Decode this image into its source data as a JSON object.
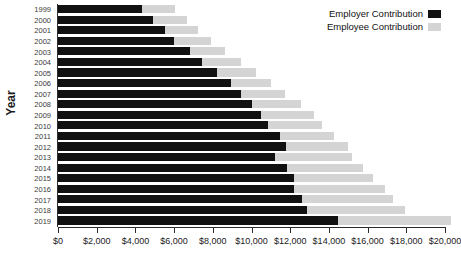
{
  "chart_data": {
    "type": "bar",
    "orientation": "horizontal",
    "stacked": true,
    "title": "",
    "xlabel": "",
    "ylabel": "Year",
    "xlim": [
      0,
      20000
    ],
    "ylim_categories": 21,
    "grid": false,
    "legend_position": "top-right",
    "categories": [
      "1999",
      "2000",
      "2001",
      "2002",
      "2003",
      "2004",
      "2005",
      "2006",
      "2007",
      "2008",
      "2009",
      "2010",
      "2011",
      "2012",
      "2013",
      "2014",
      "2015",
      "2016",
      "2017",
      "2018",
      "2019"
    ],
    "series": [
      {
        "name": "Employer Contribution",
        "color": "#111111",
        "values": [
          4360,
          4930,
          5520,
          5990,
          6830,
          7460,
          8240,
          8930,
          9450,
          10030,
          10500,
          10870,
          11450,
          11760,
          11230,
          11810,
          12180,
          12180,
          12600,
          12860,
          14450
        ]
      },
      {
        "name": "Employee Contribution",
        "color": "#d4d4d4",
        "values": [
          1680,
          1730,
          1730,
          1940,
          1790,
          2000,
          2000,
          2100,
          2260,
          2520,
          2730,
          2780,
          2830,
          3250,
          3940,
          3940,
          4090,
          4720,
          4720,
          5090,
          5850
        ]
      }
    ],
    "totals": [
      6040,
      6660,
      7250,
      7930,
      8620,
      9460,
      10240,
      11030,
      11710,
      12550,
      13230,
      13650,
      14280,
      15010,
      15170,
      15750,
      16270,
      16900,
      17320,
      17950,
      20300
    ],
    "xticks": [
      0,
      2000,
      4000,
      6000,
      8000,
      10000,
      12000,
      14000,
      16000,
      18000,
      20000
    ],
    "xtick_labels": [
      "$0",
      "$2,000",
      "$4,000",
      "$6,000",
      "$8,000",
      "$10,000",
      "$12,000",
      "$14,000",
      "$16,000",
      "$18,000",
      "$20,000"
    ]
  },
  "axis": {
    "y_title": "Year"
  },
  "legend": {
    "items": [
      {
        "label": "Employer Contribution",
        "color": "#111111",
        "swatch_name": "employer-swatch"
      },
      {
        "label": "Employee Contribution",
        "color": "#d4d4d4",
        "swatch_name": "employee-swatch"
      }
    ]
  }
}
